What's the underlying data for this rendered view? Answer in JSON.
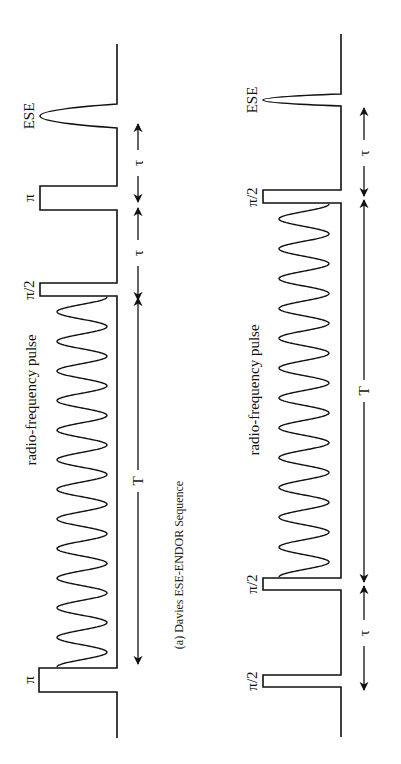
{
  "figure": {
    "caption": "(a) Davies ESE-ENDOR Sequence",
    "orientation": "rotated 90° (time runs bottom-to-top)",
    "colors": {
      "ink": "#111111",
      "background": "#ffffff"
    }
  },
  "left_sequence": {
    "name": "Davies ESE-ENDOR",
    "pulses": [
      {
        "label": "π",
        "type": "microwave"
      },
      {
        "label": "radio-frequency pulse",
        "type": "rf"
      },
      {
        "label": "π/2",
        "type": "microwave"
      },
      {
        "label": "π",
        "type": "microwave"
      },
      {
        "label": "ESE",
        "type": "echo"
      }
    ],
    "intervals": [
      {
        "label": "T"
      },
      {
        "label": "τ"
      },
      {
        "label": "τ"
      }
    ]
  },
  "right_sequence": {
    "pulses": [
      {
        "label": "π/2",
        "type": "microwave"
      },
      {
        "label": "π/2",
        "type": "microwave"
      },
      {
        "label": "radio-frequency pulse",
        "type": "rf"
      },
      {
        "label": "π/2",
        "type": "microwave"
      },
      {
        "label": "ESE",
        "type": "echo"
      }
    ],
    "intervals": [
      {
        "label": "τ"
      },
      {
        "label": "T"
      },
      {
        "label": "τ"
      }
    ]
  },
  "labels": {
    "left": {
      "ese": "ESE",
      "pi_top": "π",
      "pi2": "π/2",
      "rf": "radio-frequency pulse",
      "pi_bottom": "π",
      "tau1": "τ",
      "tau2": "τ",
      "T": "T"
    },
    "right": {
      "ese": "ESE",
      "pi2_top": "π/2",
      "rf": "radio-frequency pulse",
      "pi2_mid": "π/2",
      "pi2_bottom": "π/2",
      "tau1": "τ",
      "tau2": "τ",
      "T": "T"
    }
  }
}
